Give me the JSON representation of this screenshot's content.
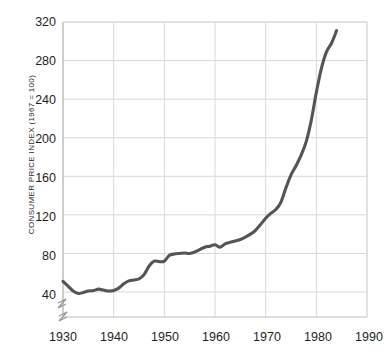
{
  "chart_data": {
    "type": "line",
    "title": "",
    "xlabel": "",
    "ylabel": "CONSUMER PRICE INDEX (1967 = 100)",
    "xlim": [
      1930,
      1990
    ],
    "ylim": [
      24,
      320
    ],
    "xticks": [
      1930,
      1940,
      1950,
      1960,
      1970,
      1980,
      1990
    ],
    "yticks": [
      40,
      80,
      120,
      160,
      200,
      240,
      280,
      320
    ],
    "grid": true,
    "legend": null,
    "axis_break": "y-axis break below 40 near origin",
    "line_color": "#555555",
    "grid_color": "#d8d8d8",
    "series": [
      {
        "name": "Consumer Price Index",
        "x": [
          1930,
          1931,
          1932,
          1933,
          1934,
          1935,
          1936,
          1937,
          1938,
          1939,
          1940,
          1941,
          1942,
          1943,
          1944,
          1945,
          1946,
          1947,
          1948,
          1949,
          1950,
          1951,
          1952,
          1953,
          1954,
          1955,
          1956,
          1957,
          1958,
          1959,
          1960,
          1961,
          1962,
          1963,
          1964,
          1965,
          1966,
          1967,
          1968,
          1969,
          1970,
          1971,
          1972,
          1973,
          1974,
          1975,
          1976,
          1977,
          1978,
          1979,
          1980,
          1981,
          1982,
          1983,
          1984
        ],
        "values": [
          51.0,
          46.0,
          41.0,
          38.5,
          39.5,
          41.0,
          41.5,
          43.0,
          42.0,
          41.0,
          41.5,
          44.0,
          48.5,
          51.5,
          52.5,
          53.5,
          58.0,
          67.0,
          72.0,
          71.5,
          72.0,
          78.0,
          79.5,
          80.0,
          80.5,
          80.0,
          81.5,
          84.0,
          86.5,
          87.5,
          89.0,
          86.5,
          90.0,
          91.5,
          93.0,
          94.5,
          97.0,
          100.0,
          104.0,
          110.0,
          116.5,
          121.5,
          125.5,
          133.0,
          148.0,
          161.5,
          171.0,
          182.0,
          196.0,
          218.0,
          247.0,
          272.0,
          289.0,
          298.0,
          311.0
        ]
      }
    ]
  },
  "axis": {
    "y_title": "CONSUMER PRICE INDEX (1967 = 100)",
    "y_tick_labels": [
      "320",
      "280",
      "240",
      "200",
      "160",
      "120",
      "80",
      "40"
    ],
    "x_tick_labels": [
      "1930",
      "1940",
      "1950",
      "1960",
      "1970",
      "1980",
      "1990"
    ]
  }
}
